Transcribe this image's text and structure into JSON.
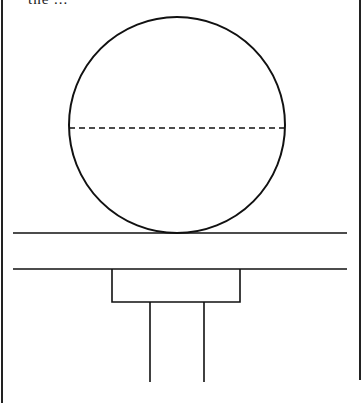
{
  "figure": {
    "clipped_caption": "the ... ",
    "colors": {
      "stroke": "#111111",
      "background": "#ffffff"
    },
    "frame": {
      "left_x": 2,
      "right_x": 360,
      "right_bottom_y": 380
    },
    "ball": {
      "cx": 177,
      "cy": 125,
      "r": 108,
      "equator_dashed": true
    },
    "surface_lines": [
      {
        "y": 233,
        "x1": 13,
        "x2": 347
      },
      {
        "y": 269,
        "x1": 13,
        "x2": 347
      }
    ],
    "bracket": {
      "x1": 112,
      "x2": 240,
      "y1": 269,
      "y2": 302
    },
    "legs": [
      {
        "x": 150,
        "y1": 302,
        "y2": 382
      },
      {
        "x": 204,
        "y1": 302,
        "y2": 382
      }
    ]
  }
}
